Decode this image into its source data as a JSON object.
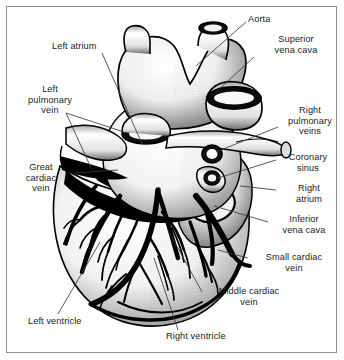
{
  "figure": {
    "type": "anatomical-illustration",
    "style": "black-and-white stipple line engraving",
    "border_color": "#8e8e8e",
    "background_color": "#ffffff",
    "ink_color": "#000000",
    "leader_line_color": "#333333"
  },
  "labels": [
    {
      "id": "aorta",
      "text": "Aorta",
      "align": "left",
      "x": 248,
      "y": 16,
      "w": 70
    },
    {
      "id": "superior-vena-cava",
      "text": "Superior\nvena cava",
      "align": "center",
      "x": 258,
      "y": 35,
      "w": 78
    },
    {
      "id": "left-atrium",
      "text": "Left atrium",
      "align": "left",
      "x": 52,
      "y": 42,
      "w": 70
    },
    {
      "id": "left-pulmonary-vein",
      "text": "Left\npulmonary\nvein",
      "align": "center",
      "x": 18,
      "y": 86,
      "w": 68
    },
    {
      "id": "right-pulmonary-veins",
      "text": "Right\npulmonary\nveins",
      "align": "center",
      "x": 282,
      "y": 106,
      "w": 60
    },
    {
      "id": "coronary-sinus",
      "text": "Coronary\nsinus",
      "align": "center",
      "x": 278,
      "y": 153,
      "w": 62
    },
    {
      "id": "great-cardiac-vein",
      "text": "Great\ncardiac\nvein",
      "align": "center",
      "x": 12,
      "y": 163,
      "w": 60
    },
    {
      "id": "right-atrium",
      "text": "Right\natrium",
      "align": "center",
      "x": 280,
      "y": 183,
      "w": 58
    },
    {
      "id": "inferior-vena-cava",
      "text": "Inferior\nvena cava",
      "align": "center",
      "x": 270,
      "y": 215,
      "w": 70
    },
    {
      "id": "small-cardiac-vein",
      "text": "Small cardiac\nvein",
      "align": "center",
      "x": 250,
      "y": 257,
      "w": 90
    },
    {
      "id": "middle-cardiac-vein",
      "text": "Middle cardiac\nvein",
      "align": "center",
      "x": 204,
      "y": 290,
      "w": 92
    },
    {
      "id": "left-ventricle",
      "text": "Left ventricle",
      "align": "left",
      "x": 28,
      "y": 318,
      "w": 86
    },
    {
      "id": "right-ventricle",
      "text": "Right ventricle",
      "align": "left",
      "x": 166,
      "y": 333,
      "w": 92
    }
  ],
  "leader_lines": [
    {
      "id": "leader-aorta",
      "points": "246,22 196,66"
    },
    {
      "id": "leader-superior-vena-cava",
      "points": "254,56 214,92"
    },
    {
      "id": "leader-left-atrium",
      "points": "100,52 140,142"
    },
    {
      "id": "leader-left-pulmonary-vein-1",
      "points": "64,112 112,134"
    },
    {
      "id": "leader-left-pulmonary-vein-2",
      "points": "64,112 84,168"
    },
    {
      "id": "leader-right-pulmonary-veins",
      "points": "278,126 214,134"
    },
    {
      "id": "leader-coronary-sinus",
      "points": "276,160 214,186"
    },
    {
      "id": "leader-great-cardiac-vein",
      "points": "72,174 112,170"
    },
    {
      "id": "leader-right-atrium",
      "points": "276,188 214,180"
    },
    {
      "id": "leader-inferior-vena-cava",
      "points": "266,222 208,214"
    },
    {
      "id": "leader-small-cardiac-vein",
      "points": "248,258 214,246"
    },
    {
      "id": "leader-middle-cardiac-vein",
      "points": "202,292 170,228"
    },
    {
      "id": "leader-left-ventricle",
      "points": "58,314 98,246"
    },
    {
      "id": "leader-right-ventricle",
      "points": "176,330 152,262"
    }
  ]
}
